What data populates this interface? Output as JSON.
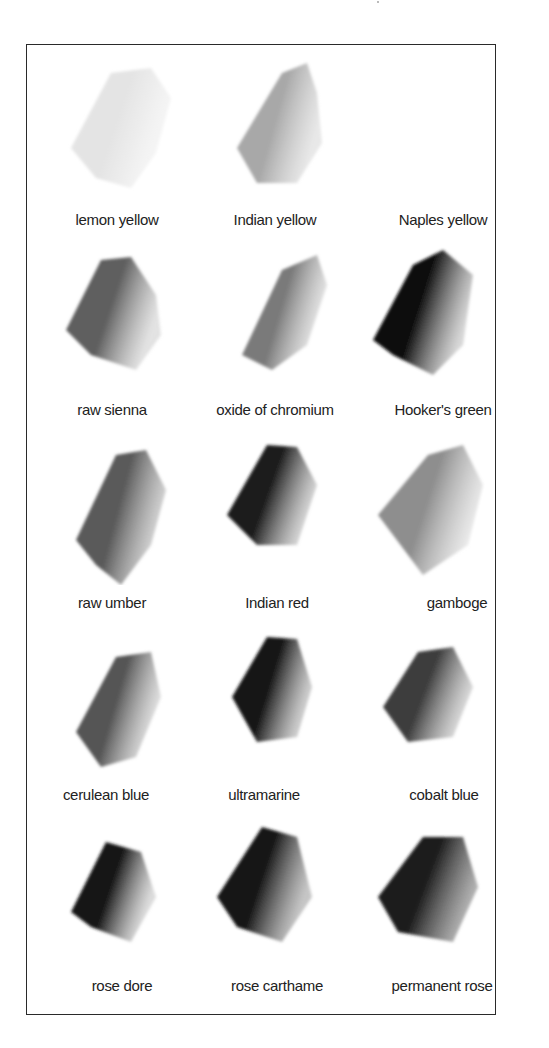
{
  "swatches": [
    {
      "label": "lemon yellow",
      "tone": "#e4e4e4",
      "fade": "#f0f0f0"
    },
    {
      "label": "Indian yellow",
      "tone": "#a8a8a8",
      "fade": "#d8d8d8"
    },
    {
      "label": "Naples yellow",
      "tone": "#f6f6f6",
      "fade": "#fbfbfb"
    },
    {
      "label": "raw sienna",
      "tone": "#5e5e5e",
      "fade": "#cfcfcf"
    },
    {
      "label": "oxide of chromium",
      "tone": "#7a7a7a",
      "fade": "#dadada"
    },
    {
      "label": "Hooker's green",
      "tone": "#111111",
      "fade": "#bdbdbd"
    },
    {
      "label": "raw umber",
      "tone": "#5a5a5a",
      "fade": "#bcbcbc"
    },
    {
      "label": "Indian red",
      "tone": "#1c1c1c",
      "fade": "#b5b5b5"
    },
    {
      "label": "gamboge",
      "tone": "#8e8e8e",
      "fade": "#dddddd"
    },
    {
      "label": "cerulean blue",
      "tone": "#555555",
      "fade": "#cccccc"
    },
    {
      "label": "ultramarine",
      "tone": "#141414",
      "fade": "#a8a8a8"
    },
    {
      "label": "cobalt blue",
      "tone": "#3c3c3c",
      "fade": "#bdbdbd"
    },
    {
      "label": "rose dore",
      "tone": "#161616",
      "fade": "#c4c4c4"
    },
    {
      "label": "rose carthame",
      "tone": "#151515",
      "fade": "#9e9e9e"
    },
    {
      "label": "permanent rose",
      "tone": "#1a1a1a",
      "fade": "#7a7a7a"
    }
  ]
}
